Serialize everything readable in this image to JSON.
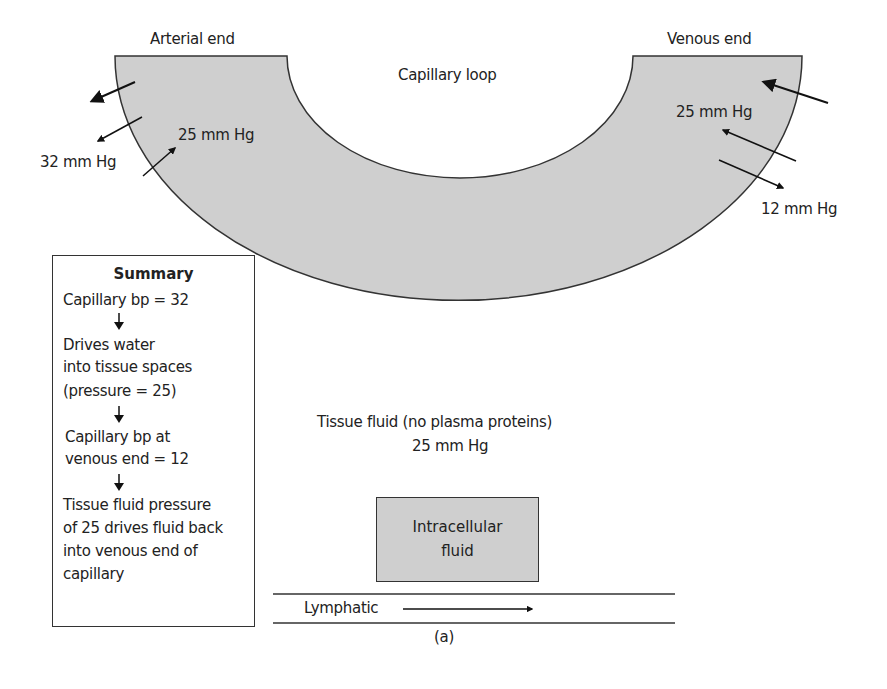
{
  "diagram": {
    "labels": {
      "arterial_end": "Arterial end",
      "venous_end": "Venous end",
      "capillary_loop": "Capillary loop",
      "arterial_outflow_pressure": "32 mm Hg",
      "arterial_inflow_pressure": "25 mm Hg",
      "venous_inflow_pressure": "25 mm Hg",
      "venous_outflow_pressure": "12 mm Hg",
      "tissue_fluid": "Tissue fluid (no plasma proteins)",
      "tissue_fluid_pressure": "25 mm Hg",
      "intracellular_line1": "Intracellular",
      "intracellular_line2": "fluid",
      "lymphatic": "Lymphatic",
      "caption": "(a)"
    },
    "summary": {
      "title": "Summary",
      "lines": [
        "Capillary bp = 32",
        "Drives water",
        "into tissue spaces",
        "(pressure = 25)",
        "Capillary bp at",
        "venous end = 12",
        "Tissue fluid pressure",
        "of 25 drives fluid back",
        "into venous end of",
        "capillary"
      ]
    },
    "colors": {
      "capillary_fill": "#cfcfcf",
      "stroke": "#333333"
    }
  }
}
